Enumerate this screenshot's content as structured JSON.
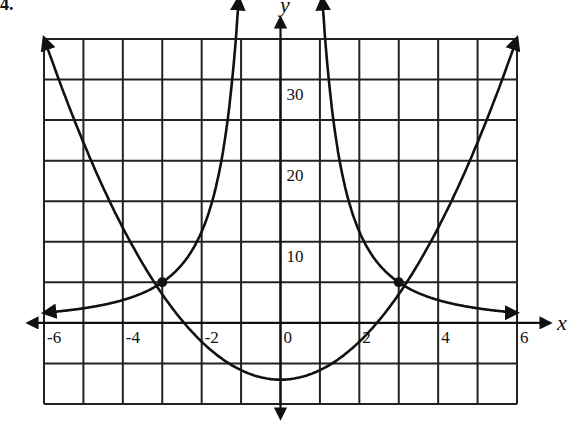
{
  "problem_number": "4.",
  "chart_data": {
    "type": "line",
    "title": "",
    "xlabel": "x",
    "ylabel": "y",
    "xlim": [
      -6,
      6
    ],
    "ylim": [
      -10,
      35
    ],
    "grid": true,
    "grid_step_x": 1,
    "grid_step_y": 5,
    "x_tick_labels": [
      "-6",
      "-4",
      "-2",
      "0",
      "2",
      "4",
      "6"
    ],
    "x_tick_values": [
      -6,
      -4,
      -2,
      0,
      2,
      4,
      6
    ],
    "y_tick_labels": [
      "10",
      "20",
      "30"
    ],
    "y_tick_values": [
      10,
      20,
      30
    ],
    "series": [
      {
        "name": "parabola",
        "description": "upward parabola, vertex near (0,-7)",
        "x": [
          -6,
          -4,
          -3,
          -2,
          -1,
          0,
          1,
          2,
          3,
          4,
          6
        ],
        "values": [
          36.2,
          12.2,
          3.8,
          -2.2,
          -5.8,
          -7,
          -5.8,
          -2.2,
          3.8,
          12.2,
          36.2
        ]
      },
      {
        "name": "reciprocal-square",
        "description": "y = k/x^2 curve with vertical asymptote at x=0",
        "x": [
          -6,
          -4,
          -3,
          -2,
          -1.2,
          1.2,
          2,
          3,
          4,
          6
        ],
        "values": [
          1.25,
          2.8,
          5,
          11.25,
          31,
          31,
          11.25,
          5,
          2.8,
          1.25
        ]
      }
    ],
    "intersection_points": [
      {
        "x": -3,
        "y": 5
      },
      {
        "x": 3,
        "y": 5
      }
    ],
    "legend": []
  }
}
